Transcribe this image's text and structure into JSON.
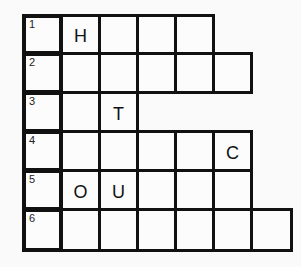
{
  "puzzle": {
    "type": "crossword",
    "rows": [
      {
        "number": "1",
        "length": 5,
        "letters": [
          "",
          "H",
          "",
          "",
          ""
        ]
      },
      {
        "number": "2",
        "length": 6,
        "letters": [
          "",
          "",
          "",
          "",
          "",
          ""
        ]
      },
      {
        "number": "3",
        "length": 3,
        "letters": [
          "",
          "",
          "T"
        ]
      },
      {
        "number": "4",
        "length": 6,
        "letters": [
          "",
          "",
          "",
          "",
          "",
          "C"
        ]
      },
      {
        "number": "5",
        "length": 6,
        "letters": [
          "",
          "O",
          "U",
          "",
          "",
          ""
        ]
      },
      {
        "number": "6",
        "length": 7,
        "letters": [
          "",
          "",
          "",
          "",
          "",
          "",
          ""
        ]
      }
    ]
  },
  "colors": {
    "border": "#111111",
    "background": "#fafafa"
  }
}
